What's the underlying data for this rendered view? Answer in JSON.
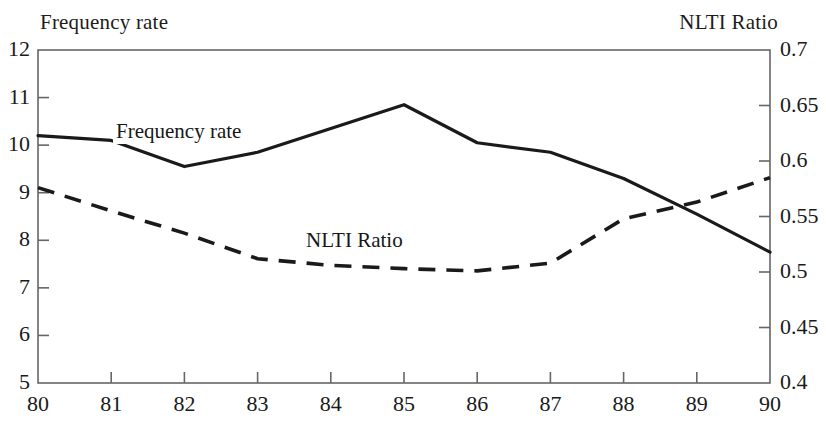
{
  "figure": {
    "top_cut_text": "",
    "left_axis_header": "Frequency rate",
    "right_axis_header": "NLTI Ratio"
  },
  "axes": {
    "left_ticks": [
      "12",
      "11",
      "10",
      "9",
      "8",
      "7",
      "6",
      "5"
    ],
    "right_ticks": [
      "0.7",
      "0.65",
      "0.6",
      "0.55",
      "0.5",
      "0.45",
      "0.4"
    ],
    "x_ticks": [
      "80",
      "81",
      "82",
      "83",
      "84",
      "85",
      "86",
      "87",
      "88",
      "89",
      "90"
    ]
  },
  "series_labels": {
    "frequency": "Frequency rate",
    "nlti": "NLTI Ratio"
  },
  "colors": {
    "line": "#1a1a1a",
    "axis": "#555555",
    "background": "#ffffff"
  },
  "chart_data": {
    "type": "line",
    "title": "",
    "subtitle": "",
    "xlabel": "",
    "ylabel": "Frequency rate",
    "y2label": "NLTI Ratio",
    "grid": false,
    "legend_position": "inline-annotations",
    "x": [
      80,
      81,
      82,
      83,
      84,
      85,
      86,
      87,
      88,
      89,
      90
    ],
    "xlim": [
      80,
      90
    ],
    "ylim": [
      5,
      12
    ],
    "y2lim": [
      0.4,
      0.7
    ],
    "y_tick_values": [
      5,
      6,
      7,
      8,
      9,
      10,
      11,
      12
    ],
    "y2_tick_values": [
      0.4,
      0.45,
      0.5,
      0.55,
      0.6,
      0.65,
      0.7
    ],
    "series": [
      {
        "name": "Frequency rate",
        "axis": "left",
        "style": "solid",
        "values": [
          10.2,
          10.1,
          9.55,
          9.85,
          10.35,
          10.85,
          10.05,
          9.85,
          9.3,
          8.55,
          7.75
        ]
      },
      {
        "name": "NLTI Ratio",
        "axis": "right",
        "style": "dashed",
        "values": [
          0.576,
          0.555,
          0.535,
          0.512,
          0.506,
          0.503,
          0.501,
          0.508,
          0.548,
          0.563,
          0.585
        ]
      }
    ],
    "annotations": [
      {
        "text": "Frequency rate",
        "x": 81.0,
        "y": 10.4,
        "axis": "left"
      },
      {
        "text": "NLTI Ratio",
        "x": 83.6,
        "y": 0.523,
        "axis": "right"
      }
    ]
  }
}
